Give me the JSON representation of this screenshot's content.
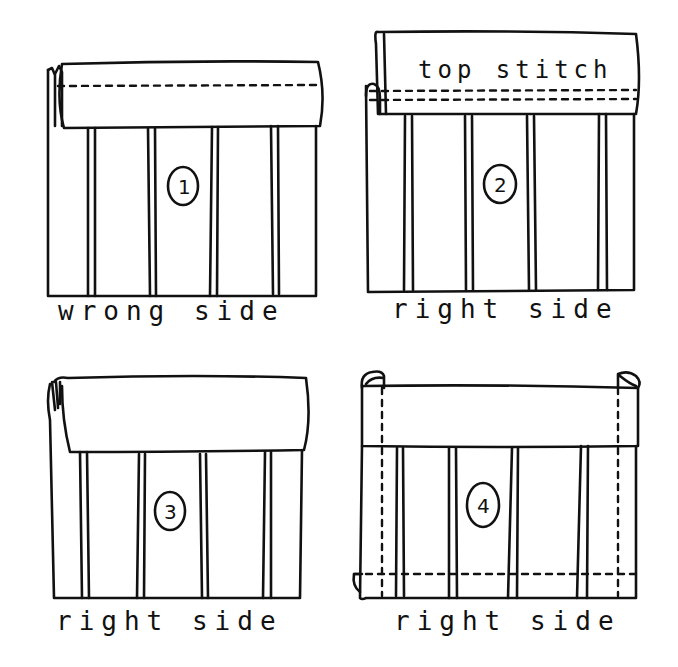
{
  "diagram": {
    "panels": [
      {
        "step": "1",
        "label": "wrong side",
        "annotation": ""
      },
      {
        "step": "2",
        "label": "right side",
        "annotation": "top stitch"
      },
      {
        "step": "3",
        "label": "right side",
        "annotation": ""
      },
      {
        "step": "4",
        "label": "right side",
        "annotation": ""
      }
    ]
  }
}
